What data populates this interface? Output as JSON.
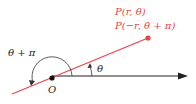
{
  "labels": {
    "point_line1": "P(r, θ)",
    "point_line2": "P(−r, θ + π)",
    "angle_theta": "θ",
    "angle_theta_pi": "θ + π",
    "origin": "O"
  },
  "colors": {
    "ray": "#e8444a",
    "point_text": "#e8444a",
    "axis": "#222222",
    "arc": "#333333"
  }
}
